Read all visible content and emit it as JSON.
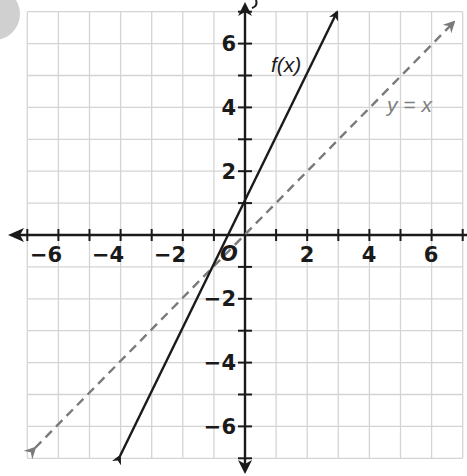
{
  "chart_data": {
    "type": "line",
    "title": "",
    "xlabel": "x",
    "ylabel": "y",
    "xlim": [
      -7,
      7
    ],
    "ylim": [
      -7,
      7
    ],
    "grid": true,
    "x_tick_labels": [
      "-6",
      "-4",
      "-2",
      "2",
      "4",
      "6"
    ],
    "y_tick_labels": [
      "6",
      "4",
      "2",
      "-2",
      "-4",
      "-6"
    ],
    "origin_label": "O",
    "series": [
      {
        "name": "f(x)",
        "style": "solid",
        "color": "#1a1a1a",
        "equation": "y = 2x + 1",
        "x": [
          -4,
          3
        ],
        "y": [
          -7,
          7
        ]
      },
      {
        "name": "y = x",
        "style": "dashed",
        "color": "#808080",
        "equation": "y = x",
        "x": [
          -7,
          7
        ],
        "y": [
          -7,
          7
        ]
      }
    ],
    "annotations": [
      {
        "text": "f(x)",
        "x": 1.3,
        "y": 5.2
      },
      {
        "text": "y = x",
        "x": 4.6,
        "y": 3.9
      }
    ]
  },
  "labels": {
    "x_ticks": [
      "−6",
      "−4",
      "−2",
      "2",
      "4",
      "6"
    ],
    "y_ticks": [
      "6",
      "4",
      "2",
      "−2",
      "−4",
      "−6"
    ],
    "origin": "O",
    "f_label": "f(x)",
    "identity_label": "y = x",
    "y_axis_label": "y"
  }
}
